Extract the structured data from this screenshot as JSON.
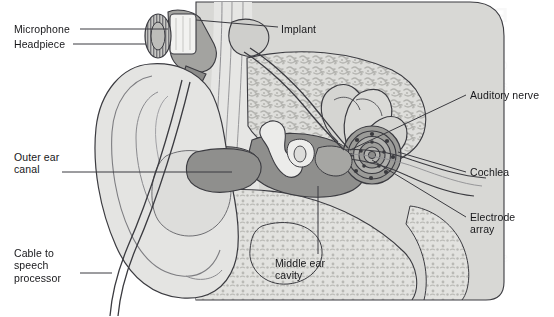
{
  "figure": {
    "kind": "anatomical-diagram",
    "background_color": "#ffffff",
    "palette": {
      "outline": "#3b3b40",
      "skin_light": "#e3e3e1",
      "skin_mid": "#d2d2cf",
      "head_fill": "#d7d7d4",
      "bone_fill": "#dcdcd9",
      "bone_speckle": "#b4b4b0",
      "cavity_dark": "#8e8e8c",
      "cavity_mid": "#a9a9a6",
      "canal_gray": "#9a9a97",
      "device_gray": "#8a8a88",
      "cochlea_dark": "#6f6f6d",
      "leader_line": "#3b3b40",
      "text": "#17171a",
      "ghost_text": "#f2f2f2"
    }
  },
  "labels": [
    {
      "id": "microphone",
      "text": "Microphone",
      "x": 14,
      "y": 24,
      "align": "left"
    },
    {
      "id": "headpiece",
      "text": "Headpiece",
      "x": 14,
      "y": 39,
      "align": "left"
    },
    {
      "id": "implant",
      "text": "Implant",
      "x": 281,
      "y": 24,
      "align": "left"
    },
    {
      "id": "auditory-nerve",
      "text": "Auditory nerve",
      "x": 470,
      "y": 90,
      "align": "left"
    },
    {
      "id": "cochlea",
      "text": "Cochlea",
      "x": 470,
      "y": 168,
      "align": "left"
    },
    {
      "id": "electrode-array",
      "text": "Electrode\narray",
      "x": 470,
      "y": 212,
      "align": "left"
    },
    {
      "id": "outer-ear-canal",
      "text": "Outer ear\ncanal",
      "x": 14,
      "y": 152,
      "align": "left"
    },
    {
      "id": "cable-to-speech-processor",
      "text": "Cable to\nspeech\nprocessor",
      "x": 14,
      "y": 248,
      "align": "left"
    },
    {
      "id": "middle-ear-cavity",
      "text": "Middle ear\ncavity",
      "x": 275,
      "y": 258,
      "align": "left"
    }
  ],
  "leader_lines": [
    {
      "id": "leader-microphone",
      "from": [
        80,
        29
      ],
      "to": [
        163,
        29
      ],
      "note": "horizontal to microphone disc"
    },
    {
      "id": "leader-headpiece",
      "from": [
        73,
        44
      ],
      "to": [
        150,
        44
      ],
      "note": "horizontal to headpiece coil"
    },
    {
      "id": "leader-implant",
      "from": [
        278,
        29
      ],
      "to": [
        170,
        22
      ],
      "note": "left to implant body under skin"
    },
    {
      "id": "leader-auditory-nerve",
      "from": [
        466,
        95
      ],
      "to": [
        350,
        148
      ],
      "note": "diagonal down-left to nerve bundle"
    },
    {
      "id": "leader-cochlea",
      "from": [
        466,
        173
      ],
      "to": [
        388,
        150
      ],
      "note": "left to cochlear spiral"
    },
    {
      "id": "leader-electrode-array",
      "from": [
        466,
        218
      ],
      "to": [
        360,
        152
      ],
      "note": "diagonal up-left into cochlea"
    },
    {
      "id": "leader-outer-ear-canal",
      "from": [
        60,
        172
      ],
      "to": [
        228,
        172
      ],
      "note": "long horizontal into ear canal"
    },
    {
      "id": "leader-cable",
      "from": [
        78,
        273
      ],
      "to": [
        110,
        273
      ],
      "note": "short horizontal to cable"
    },
    {
      "id": "leader-middle-ear",
      "from": [
        318,
        254
      ],
      "to": [
        318,
        188
      ],
      "note": "vertical up into middle ear cavity"
    }
  ],
  "anatomy_parts": [
    {
      "id": "pinna",
      "name": "Outer ear (pinna)"
    },
    {
      "id": "ear-canal",
      "name": "Outer ear canal"
    },
    {
      "id": "middle-ear-cavity",
      "name": "Middle ear cavity"
    },
    {
      "id": "ossicles",
      "name": "Middle ear ossicles"
    },
    {
      "id": "semicircular-canals",
      "name": "Semicircular canals"
    },
    {
      "id": "cochlea-spiral",
      "name": "Cochlea"
    },
    {
      "id": "auditory-nerve",
      "name": "Auditory nerve"
    },
    {
      "id": "temporal-bone",
      "name": "Temporal bone (speckled)"
    },
    {
      "id": "skull-skin",
      "name": "Scalp / skin layers"
    }
  ],
  "device_parts": [
    {
      "id": "microphone-unit",
      "name": "Microphone"
    },
    {
      "id": "headpiece-coil",
      "name": "Headpiece transmitter coil"
    },
    {
      "id": "implant-receiver",
      "name": "Implanted receiver/stimulator"
    },
    {
      "id": "electrode-array",
      "name": "Electrode array in cochlea"
    },
    {
      "id": "cable",
      "name": "Cable to speech processor"
    }
  ],
  "ghost_text": {
    "present": true,
    "note": "faint show-through of reverse-page heading in upper right",
    "line": "Real-Time Captioning/Interpret"
  }
}
